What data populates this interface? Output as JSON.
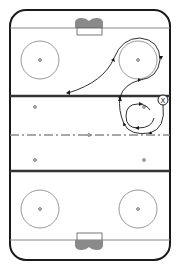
{
  "diagram": {
    "type": "hockey-rink-drill",
    "width": 180,
    "height": 270,
    "colors": {
      "board": "#1a1a1a",
      "line": "#888888",
      "blue_line": "#333333",
      "red_line": "#8a8a8a",
      "circle": "#8c8c8c",
      "dot": "#666666",
      "net": "#8a8a8a",
      "path": "#1a1a1a"
    },
    "player_marker": {
      "label": "X",
      "x": 163,
      "y": 100
    },
    "rink": {
      "goal_line_top_y": 28,
      "goal_line_bottom_y": 240,
      "blue_line_top_y": 96,
      "blue_line_bottom_y": 171,
      "center_line_y": 135,
      "faceoff_circles": [
        {
          "name": "top-left",
          "cx": 40,
          "cy": 60,
          "r": 19
        },
        {
          "name": "top-right",
          "cx": 138,
          "cy": 60,
          "r": 19
        },
        {
          "name": "bottom-left",
          "cx": 40,
          "cy": 209,
          "r": 19
        },
        {
          "name": "bottom-right",
          "cx": 138,
          "cy": 209,
          "r": 19
        }
      ],
      "neutral_dots": [
        {
          "cx": 35,
          "cy": 107
        },
        {
          "cx": 144,
          "cy": 107
        },
        {
          "cx": 89,
          "cy": 135
        },
        {
          "cx": 35,
          "cy": 160
        },
        {
          "cx": 144,
          "cy": 160
        }
      ]
    }
  }
}
